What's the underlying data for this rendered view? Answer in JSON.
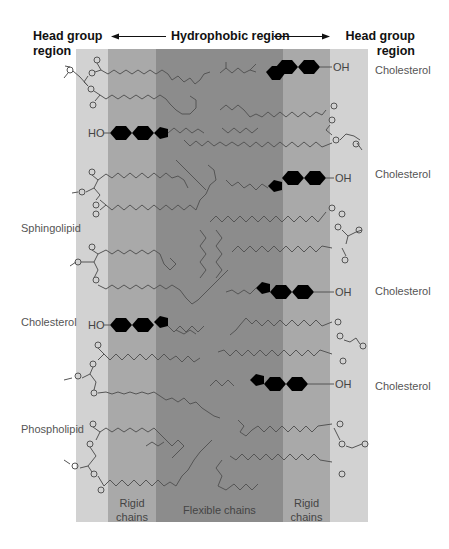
{
  "header": {
    "left": [
      "Head group",
      "region"
    ],
    "center": "Hydrophobic region",
    "right": [
      "Head group",
      "region"
    ]
  },
  "bands": [
    {
      "name": "head-group-left",
      "x": 76,
      "w": 32,
      "color": "#d2d2d2"
    },
    {
      "name": "rigid-left",
      "x": 108,
      "w": 48,
      "color": "#a9a9a9"
    },
    {
      "name": "flexible",
      "x": 156,
      "w": 127,
      "color": "#8c8c8c"
    },
    {
      "name": "rigid-right",
      "x": 283,
      "w": 47,
      "color": "#a9a9a9"
    },
    {
      "name": "head-group-right",
      "x": 330,
      "w": 38,
      "color": "#d2d2d2"
    }
  ],
  "band_labels": {
    "rigid_left": [
      "Rigid",
      "chains"
    ],
    "flexible": "Flexible chains",
    "rigid_right": [
      "Rigid",
      "chains"
    ]
  },
  "left_labels": [
    {
      "text": "Sphingolipid",
      "y": 228
    },
    {
      "text": "Cholesterol",
      "y": 322
    },
    {
      "text": "Phospholipid",
      "y": 429
    }
  ],
  "right_labels": [
    {
      "text": "Cholesterol",
      "y": 70
    },
    {
      "text": "Cholesterol",
      "y": 174
    },
    {
      "text": "Cholesterol",
      "y": 291
    },
    {
      "text": "Cholesterol",
      "y": 386
    }
  ],
  "atom_labels": {
    "hydroxyl": "OH",
    "hydroxyl_left": "HO"
  }
}
